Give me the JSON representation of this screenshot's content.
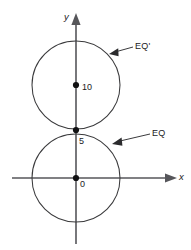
{
  "figure": {
    "background_color": "#ffffff",
    "line_color": "#3a3a3c",
    "axis_color": "#56565a",
    "point_color": "#111113",
    "width": 191,
    "height": 250
  },
  "axes": {
    "y_label": "y",
    "x_label": "x",
    "origin_label": "0",
    "y_axis_direction": "up",
    "x_axis_direction": "right"
  },
  "points": [
    {
      "id": "origin",
      "label": "0",
      "x": 0,
      "y": 0,
      "px": 76,
      "py": 178
    },
    {
      "id": "tangency",
      "label": "5",
      "x": 0,
      "y": 5,
      "px": 76,
      "py": 130
    },
    {
      "id": "center-upper",
      "label": "10",
      "x": 0,
      "y": 10,
      "px": 76,
      "py": 85
    }
  ],
  "curves": [
    {
      "id": "lower-circle",
      "label": "EQ",
      "center_x": 0,
      "center_y": 0,
      "radius": 5,
      "cx_px": 76,
      "cy_px": 178,
      "r_px": 44
    },
    {
      "id": "upper-circle",
      "label": "EQ'",
      "center_x": 0,
      "center_y": 10,
      "radius": 5,
      "cx_px": 76,
      "cy_px": 85,
      "r_px": 44
    }
  ],
  "annotations": [
    {
      "id": "eq-prime-callout",
      "text": "EQ'",
      "points_to": "upper-circle"
    },
    {
      "id": "eq-callout",
      "text": "EQ",
      "points_to": "lower-circle"
    }
  ],
  "value_labels": {
    "ten": "10",
    "five": "5",
    "zero": "0"
  }
}
